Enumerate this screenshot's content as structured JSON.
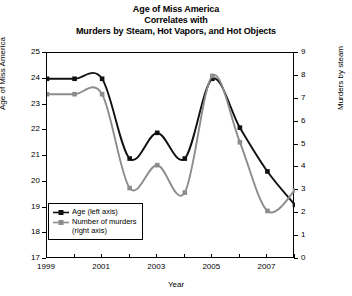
{
  "chart_data": {
    "type": "line",
    "title": "Age of Miss America\nCorrelates with\nMurders by Steam, Hot Vapors, and Hot Objects",
    "title_lines": [
      "Age of Miss America",
      "Correlates with",
      "Murders by Steam, Hot Vapors, and Hot Objects"
    ],
    "xlabel": "Year",
    "ylabel": "Age of Miss America",
    "ylabel_right": "Murders by steam",
    "x": [
      1999,
      2000,
      2001,
      2002,
      2003,
      2004,
      2005,
      2006,
      2007,
      2008
    ],
    "xlim": [
      1999,
      2008
    ],
    "xticks_major": [
      1999,
      2001,
      2003,
      2005,
      2007
    ],
    "xticks_minor": [
      2000,
      2002,
      2004,
      2006,
      2008
    ],
    "xtick_labels": [
      "1999",
      "2001",
      "2003",
      "2005",
      "2007"
    ],
    "ylim": [
      17,
      25
    ],
    "yticks": [
      17,
      18,
      19,
      20,
      21,
      22,
      23,
      24,
      25
    ],
    "ytick_labels": [
      "17",
      "18",
      "19",
      "20",
      "21",
      "22",
      "23",
      "24",
      "25"
    ],
    "ylim_right": [
      0,
      9
    ],
    "yticks_right": [
      0,
      1,
      2,
      3,
      4,
      5,
      6,
      7,
      8,
      9
    ],
    "ytick_labels_right": [
      "0",
      "1",
      "2",
      "3",
      "4",
      "5",
      "6",
      "7",
      "8",
      "9"
    ],
    "grid": false,
    "legend_position": "lower-left inside",
    "interpolation": "smooth-spline",
    "marker": "square",
    "series": [
      {
        "name": "Age (left axis)",
        "axis": "left",
        "color": "#111111",
        "values": [
          24.0,
          24.0,
          24.0,
          20.9,
          21.9,
          20.9,
          24.0,
          22.1,
          20.4,
          19.1
        ]
      },
      {
        "name": "Number of murders (right axis)",
        "axis": "right",
        "color": "#8c8c8c",
        "values": [
          7.2,
          7.2,
          7.2,
          3.1,
          4.1,
          2.9,
          8.0,
          5.1,
          2.1,
          3.0
        ]
      }
    ],
    "legend": [
      {
        "label": "Age (left axis)",
        "color": "#111111"
      },
      {
        "label": "Number of murders\n(right axis)",
        "color": "#8c8c8c",
        "label_line1": "Number of murders",
        "label_line2": "(right axis)"
      }
    ]
  }
}
